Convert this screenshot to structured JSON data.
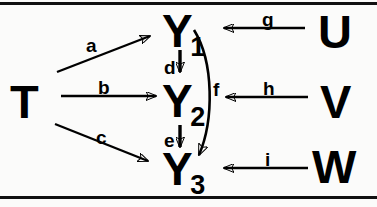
{
  "diagram": {
    "type": "path-diagram",
    "title": "",
    "frame": {
      "top_rule": true,
      "bottom_rule": true
    },
    "nodes": [
      {
        "id": "T",
        "label": "T",
        "role": "exogenous-left",
        "x": 10,
        "y": 78
      },
      {
        "id": "Y1",
        "label": "Y",
        "subscript": "1",
        "role": "endogenous",
        "x": 162,
        "y": 8
      },
      {
        "id": "Y2",
        "label": "Y",
        "subscript": "2",
        "role": "endogenous",
        "x": 162,
        "y": 78
      },
      {
        "id": "Y3",
        "label": "Y",
        "subscript": "3",
        "role": "endogenous",
        "x": 162,
        "y": 146
      },
      {
        "id": "U",
        "label": "U",
        "role": "exogenous-right",
        "x": 318,
        "y": 8
      },
      {
        "id": "V",
        "label": "V",
        "role": "exogenous-right",
        "x": 320,
        "y": 78
      },
      {
        "id": "W",
        "label": "W",
        "role": "exogenous-right",
        "x": 312,
        "y": 143
      }
    ],
    "edges": [
      {
        "id": "a",
        "label": "a",
        "from": "T",
        "to": "Y1",
        "shape": "straight-up-right",
        "label_x": 86,
        "label_y": 36
      },
      {
        "id": "b",
        "label": "b",
        "from": "T",
        "to": "Y2",
        "shape": "straight-horizontal",
        "label_x": 98,
        "label_y": 78
      },
      {
        "id": "c",
        "label": "c",
        "from": "T",
        "to": "Y3",
        "shape": "straight-down-right",
        "label_x": 96,
        "label_y": 128
      },
      {
        "id": "d",
        "label": "d",
        "from": "Y1",
        "to": "Y2",
        "shape": "straight-vertical",
        "label_x": 164,
        "label_y": 58
      },
      {
        "id": "e",
        "label": "e",
        "from": "Y2",
        "to": "Y3",
        "shape": "straight-vertical",
        "label_x": 164,
        "label_y": 131
      },
      {
        "id": "f",
        "label": "f",
        "from": "Y1",
        "to": "Y3",
        "shape": "curved-right-bow",
        "label_x": 213,
        "label_y": 80
      },
      {
        "id": "g",
        "label": "g",
        "from": "U",
        "to": "Y1",
        "shape": "straight-horizontal-left",
        "label_x": 262,
        "label_y": 10
      },
      {
        "id": "h",
        "label": "h",
        "from": "V",
        "to": "Y2",
        "shape": "straight-horizontal-left",
        "label_x": 263,
        "label_y": 79
      },
      {
        "id": "i",
        "label": "i",
        "from": "W",
        "to": "Y3",
        "shape": "straight-horizontal-left",
        "label_x": 265,
        "label_y": 150
      }
    ]
  }
}
